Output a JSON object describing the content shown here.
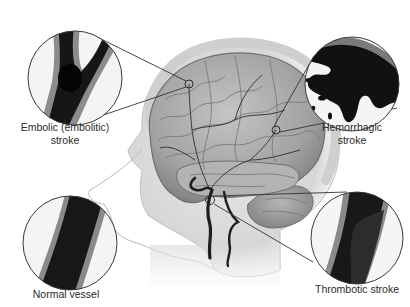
{
  "diagram": {
    "labels": {
      "embolic_line1": "Embolic (embolitic)",
      "embolic_line2": "stroke",
      "hemorrhagic_line1": "Hemorrhagic",
      "hemorrhagic_line2": "stroke",
      "normal": "Normal vessel",
      "thrombotic": "Thrombotic stroke"
    },
    "colors": {
      "background": "#ffffff",
      "vessel": "#141414",
      "vessel_wall": "#8a8a8a",
      "brain": "#a9a9a9",
      "skin": "#e8e8e8",
      "callout_line": "#333333",
      "text": "#2a2a2a"
    }
  }
}
